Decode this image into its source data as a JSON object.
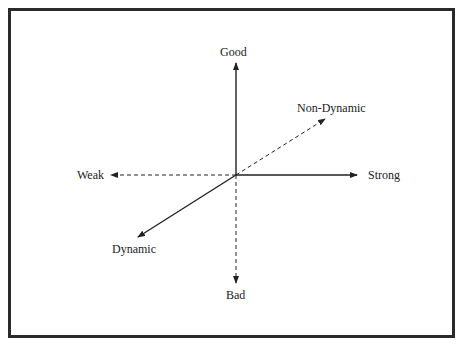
{
  "diagram": {
    "axes": {
      "good": "Good",
      "bad": "Bad",
      "weak": "Weak",
      "strong": "Strong",
      "non_dynamic": "Non-Dynamic",
      "dynamic": "Dynamic"
    },
    "colors": {
      "line": "#222222",
      "border": "#2a2a2a",
      "background": "#ffffff"
    }
  }
}
